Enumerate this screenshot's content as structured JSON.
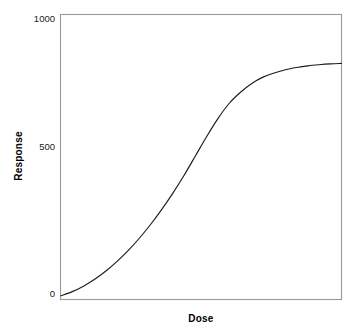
{
  "chart_data": {
    "type": "line",
    "title": "",
    "subtitle": "",
    "xlabel": "Dose",
    "ylabel": "Response",
    "grid": false,
    "legend": false,
    "legend_position": "none",
    "xlim": [
      0,
      100
    ],
    "ylim": [
      -60,
      1000
    ],
    "ytick_labels": [
      "1000",
      "500",
      "0"
    ],
    "ytick_values": [
      1000,
      500,
      0
    ],
    "xtick_labels": [],
    "xtick_values": [],
    "series": [
      {
        "name": "dose-response",
        "color": "#1c1c1c",
        "x": [
          0,
          4,
          8,
          12,
          16,
          20,
          24,
          28,
          32,
          36,
          40,
          44,
          48,
          52,
          56,
          60,
          64,
          68,
          72,
          76,
          80,
          84,
          88,
          92,
          96,
          100
        ],
        "values": [
          -10,
          5,
          25,
          50,
          80,
          115,
          155,
          200,
          250,
          305,
          365,
          430,
          500,
          570,
          635,
          690,
          730,
          762,
          785,
          800,
          812,
          820,
          826,
          830,
          833,
          835
        ]
      }
    ],
    "annotations": []
  },
  "axes": {
    "y_title": "Response",
    "x_title": "Dose",
    "y_tick_top": "1000",
    "y_tick_mid": "500",
    "y_tick_bottom": "0"
  },
  "colors": {
    "background": "#ffffff",
    "frame": "#9a9a9a",
    "curve": "#1c1c1c",
    "text": "#000000"
  }
}
